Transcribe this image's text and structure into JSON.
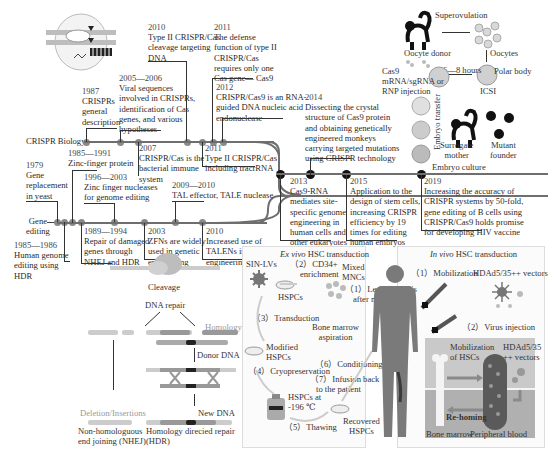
{
  "timeline": {
    "tracks": {
      "crispr_biology": "CRISPR  Biology",
      "gene_editing_line1": "Gene",
      "gene_editing_line2": "editing"
    },
    "events_top": [
      {
        "year": "1987",
        "lines": [
          "CRISPRs",
          "general",
          "description"
        ]
      },
      {
        "year": "2005—2006",
        "lines": [
          "Viral sequences",
          "involved in CRISPRs,",
          "identification of  Cas",
          "genes, and various",
          "hypotheses"
        ]
      },
      {
        "year": "2010",
        "lines": [
          "Type II CRISPR/Cas",
          "cleavage targeting",
          "DNA"
        ]
      },
      {
        "year": "2011",
        "lines": [
          "The defense",
          "function of type II",
          "CRISPR/Cas",
          "requires only one",
          "Cas gene— Cas9"
        ]
      },
      {
        "year": "2012",
        "lines": [
          "CRISPR/Cas9 is an RNA-",
          "guided DNA nucleic acid",
          "endonuclease"
        ]
      },
      {
        "year": "2014",
        "lines": [
          "Dissecting the crystal",
          "structure of  Cas9 protein",
          "and obtaining genetically",
          "engineered monkeys",
          "carrying targeted mutations",
          "using CRISPR technology"
        ]
      }
    ],
    "events_mid": [
      {
        "year": "2007",
        "lines": [
          "CRISPR/Cas is the",
          "bacterial immune",
          "system"
        ]
      },
      {
        "year": "2011",
        "lines": [
          "Type II CRISPR/Cas",
          "including tracrRNA"
        ]
      },
      {
        "year": "1985—1991",
        "lines": [
          "Zinc-finger protein"
        ]
      },
      {
        "year": "1979",
        "lines": [
          "Gene",
          "replacement",
          "in yeast"
        ]
      },
      {
        "year": "1996—2003",
        "lines": [
          "Zinc finger nucleases",
          "for genome editing"
        ]
      },
      {
        "year": "2009—2010",
        "lines": [
          "TAL effector, TALE nuclease"
        ]
      }
    ],
    "events_bottom": [
      {
        "year": "1989—1994",
        "lines": [
          "Repair of damaged",
          "genes through",
          "NHEJ and HDR"
        ]
      },
      {
        "year": "2003",
        "lines": [
          "ZFNs are widely",
          "used in genetic",
          "engineering"
        ]
      },
      {
        "year": "2010",
        "lines": [
          "Increased use of",
          "TALENs in genetic",
          "engineering"
        ]
      },
      {
        "year": "1985—1986",
        "lines": [
          "Human genome",
          "editing using",
          "HDR"
        ]
      },
      {
        "year": "2013",
        "lines": [
          "Cas9-RNA",
          "mediates site-",
          "specific genome",
          "engineering in",
          "human cells and",
          "other eukaryotes"
        ]
      },
      {
        "year": "2015",
        "lines": [
          "Application to the",
          "design of stem cells,",
          "increasing CRISPR",
          "efficiency by 19",
          "times for editing",
          "human embryos"
        ]
      },
      {
        "year": "2019",
        "lines": [
          "Increasing the accuracy of",
          "CRISPR systems by 50-fold,",
          "gene editing of B cells using",
          "CRISPR/Cas9 holds promise",
          "for developing HIV vaccine"
        ]
      }
    ]
  },
  "monkey_panel": {
    "superovulation": "Superovulation",
    "oocyte_donor": "Oocyte donor",
    "oocytes": "Oocytes",
    "polar_body": "Polar body",
    "icsi": "ICSI",
    "hours": "6—8 hours",
    "injection": [
      "Cas9",
      "mRNA/sgRNA or",
      "RNP injection"
    ],
    "embryo_transfer": [
      "Embryo",
      "transfer"
    ],
    "surrogate": [
      "Surrogate",
      "mother"
    ],
    "mutant": [
      "Mutant",
      "founder"
    ],
    "embryo_culture": "Embryo culture"
  },
  "repair_panel": {
    "cleavage": "Cleavage",
    "dna_repair": "DNA repair",
    "homology": "Homology",
    "donor_dna": "Donor DNA",
    "deletion": "Deletion/Insertions",
    "new_dna": "New DNA",
    "nhej": [
      "Non-homologuous",
      "end joining (NHEJ)"
    ],
    "hdr": [
      "Homology direcied repair",
      "(HDR)"
    ]
  },
  "exvivo_panel": {
    "title_italic": "Ex vivo",
    "title_rest": " HSC transduction",
    "sin_lvs": "SIN-LVs",
    "step2": [
      "（2）CD34+",
      "enrichment"
    ],
    "mixed": [
      "Mixed",
      "MNCs"
    ],
    "hspcs": "HSPCs",
    "step1": [
      "（1）Leukapheresis",
      "after mobilization"
    ],
    "step3": "（3）Transduction",
    "bone_marrow": [
      "Bone marrow",
      "aspiration"
    ],
    "modified": [
      "Modified",
      "HSPCs"
    ],
    "step6": "（6）Conditioning",
    "step4": "（4）Cryopreservation",
    "step7": [
      "（7）Infusion back",
      "to the patient"
    ],
    "hspcs_at": [
      "HSPCs at",
      "-196 ℃"
    ],
    "step5": "（5）Thawing",
    "recovered": [
      "Recovered",
      "HSPCs"
    ]
  },
  "invivo_panel": {
    "title_italic": "In vivo",
    "title_rest": " HSC transduction",
    "step1": "（1）Mobilization",
    "vectors": "HDAd5/35++ vectors",
    "step2": "（2）Virus injection",
    "mobilization_hscs": [
      "Mobilization",
      "of HSCs"
    ],
    "vectors2": [
      "HDAd5/35",
      "++ vectors"
    ],
    "rehoming": "Re-homing",
    "bone_marrow": "Bone marrow",
    "peripheral_blood": "Peripheral blood"
  },
  "colors": {
    "timeline_line": "#6e6e6e",
    "node_gray": "#8a8a8a",
    "node_dark": "#111111",
    "panel_bg": "#fbfbfb",
    "invivo_box_top": "#c9c9c9",
    "invivo_box_bottom": "#b0b0b0",
    "body": "#7a7a7a"
  }
}
